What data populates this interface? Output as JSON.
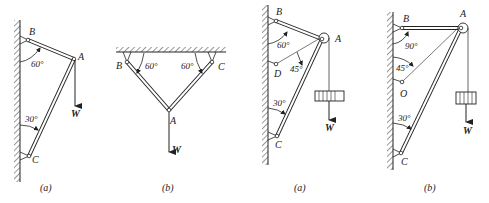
{
  "figures": [
    {
      "id": "fig1a",
      "caption": "(a)",
      "labels": {
        "B": "B",
        "A": "A",
        "C": "C",
        "W": "W"
      },
      "angles": [
        "60°",
        "30°"
      ]
    },
    {
      "id": "fig1b",
      "caption": "(b)",
      "labels": {
        "B": "B",
        "C": "C",
        "A": "A",
        "W": "W"
      },
      "angles": [
        "60°",
        "60°"
      ]
    },
    {
      "id": "fig2a",
      "caption": "(a)",
      "labels": {
        "B": "B",
        "A": "A",
        "D": "D",
        "C": "C",
        "W": "W"
      },
      "angles": [
        "60°",
        "45°",
        "30°"
      ]
    },
    {
      "id": "fig2b",
      "caption": "(b)",
      "labels": {
        "B": "B",
        "A": "A",
        "O": "O",
        "C": "C",
        "W": "W"
      },
      "angles": [
        "90°",
        "45°",
        "30°"
      ]
    }
  ],
  "colors": {
    "ink": "#222222",
    "background": "#ffffff"
  }
}
